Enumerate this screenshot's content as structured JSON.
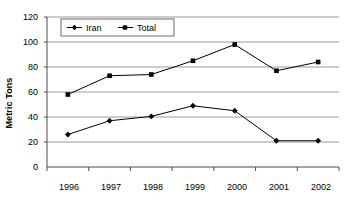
{
  "chart_data": {
    "type": "line",
    "title": "",
    "xlabel": "",
    "ylabel": "Metric Tons",
    "categories": [
      "1996",
      "1997",
      "1998",
      "1999",
      "2000",
      "2001",
      "2002"
    ],
    "series": [
      {
        "name": "Iran",
        "marker": "diamond",
        "color": "#000000",
        "values": [
          26,
          37,
          40.5,
          49,
          45,
          21,
          21
        ]
      },
      {
        "name": "Total",
        "marker": "square",
        "color": "#000000",
        "values": [
          58,
          73,
          74,
          85,
          98,
          77,
          84
        ]
      }
    ],
    "ylim": [
      0,
      120
    ],
    "yticks": [
      0,
      20,
      40,
      60,
      80,
      100,
      120
    ],
    "ytick_labels": [
      "0",
      "20",
      "40",
      "60",
      "80",
      "100",
      "120"
    ],
    "grid": "horizontal",
    "legend_position": "top-left-inside",
    "gridline_color": "#9a9a9a",
    "axis_color": "#4d4d4d",
    "background": "#ffffff"
  },
  "legend": {
    "entries": [
      {
        "label": "Iran"
      },
      {
        "label": "Total"
      }
    ]
  },
  "axis": {
    "y_title": "Metric Tons",
    "y_labels": [
      "120",
      "100",
      "80",
      "60",
      "40",
      "20",
      "0"
    ],
    "x_labels": [
      "1996",
      "1997",
      "1998",
      "1999",
      "2000",
      "2001",
      "2002"
    ]
  }
}
